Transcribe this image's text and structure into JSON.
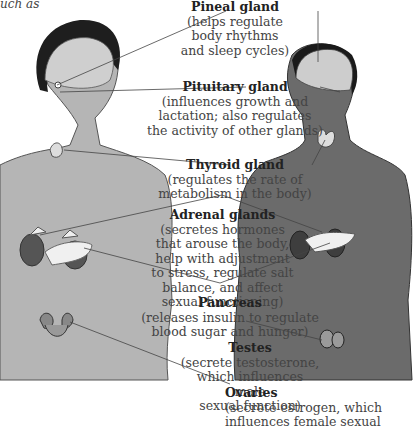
{
  "caption_fragment": "uch as",
  "side_fragments": [
    ":",
    "t"
  ],
  "glands": [
    {
      "name": "Pineal gland",
      "desc": [
        "(helps regulate",
        "body rhythms",
        "and sleep cycles)"
      ]
    },
    {
      "name": "Pituitary gland",
      "desc": [
        "(influences growth and",
        "lactation; also regulates",
        "the activity of other glands)"
      ]
    },
    {
      "name": "Thyroid gland",
      "desc": [
        "(regulates the rate of",
        "metabolism in the body)"
      ]
    },
    {
      "name": "Adrenal glands",
      "desc": [
        "(secretes hormones",
        "that arouse the body,",
        "help with adjustment",
        "to stress, regulate salt",
        "balance, and affect",
        "sexual functioning)"
      ]
    },
    {
      "name": "Pancreas",
      "desc": [
        "(releases insulin to regulate",
        "blood sugar and hunger)"
      ]
    },
    {
      "name": "Testes",
      "desc": [
        "(secrete testosterone,",
        "which influences male",
        "sexual function)"
      ]
    },
    {
      "name": "Ovaries",
      "desc": [
        "(secrete estrogen, which",
        "influences female sexual"
      ]
    }
  ],
  "colors": {
    "skin_female": "#b3b3b3",
    "skin_male": "#6e6e6e",
    "brain": "#c8c8c8",
    "gland": "#efefef",
    "organ": "#5a5a5a",
    "hair": "#222222"
  }
}
